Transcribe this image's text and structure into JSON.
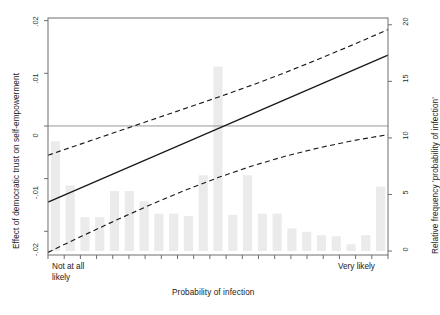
{
  "figure": {
    "axis_titles": {
      "left": "Effect of democratic trust on self-empowerment",
      "right": "Relative frequency 'probability of infection'",
      "bottom": "Probability of infection"
    },
    "x_endpoint_labels": {
      "left_line1": "Not at all",
      "left_line2": "likely",
      "right": "Very likely"
    },
    "caption": "",
    "colors": {
      "line": "#1a1a1a",
      "ci": "#1a1a1a",
      "bars": "#ebebeb",
      "zero_line": "#999999",
      "frame": "#6e6e6e",
      "background": "#ffffff"
    }
  },
  "chart_data": {
    "type": "line",
    "title": "",
    "subtitle": "",
    "xlabel": "Probability of infection",
    "ylabel": "Effect of democratic trust on self-empowerment",
    "y2label": "Relative frequency 'probability of infection'",
    "grid": false,
    "legend": "none",
    "xlim": [
      0,
      10
    ],
    "xtick_labels": [
      "Not at all likely",
      "Very likely"
    ],
    "xtick_values": [
      0,
      10
    ],
    "xticks_minor_count": 21,
    "ylim": [
      -0.0245,
      0.0205
    ],
    "ytick_labels": [
      ".02",
      ".01",
      "0",
      "-.01",
      "-.02"
    ],
    "ytick_values": [
      0.02,
      0.01,
      0,
      -0.01,
      -0.02
    ],
    "y2lim": [
      -0.35,
      20.6
    ],
    "y2tick_labels": [
      "0",
      "5",
      "10",
      "15",
      "20"
    ],
    "y2tick_values": [
      0,
      5,
      10,
      15,
      20
    ],
    "zero_reference_line": 0,
    "series": [
      {
        "name": "Marginal effect",
        "style": "solid",
        "x": [
          0,
          10
        ],
        "values": [
          -0.01445,
          0.01345
        ]
      },
      {
        "name": "Upper 95% confidence limit",
        "style": "dashed",
        "x": [
          0,
          1,
          2,
          3,
          4,
          5,
          6,
          7,
          8,
          9,
          10
        ],
        "values": [
          -0.00555,
          -0.00335,
          -0.00115,
          0.00105,
          0.00325,
          0.00545,
          0.00775,
          0.0102,
          0.0128,
          0.0155,
          0.0183
        ]
      },
      {
        "name": "Lower 95% confidence limit",
        "style": "dashed",
        "x": [
          0,
          1,
          2,
          3,
          4,
          5,
          6,
          7,
          8,
          9,
          10
        ],
        "values": [
          -0.024,
          -0.0209,
          -0.0179,
          -0.015,
          -0.0123,
          -0.0098,
          -0.0076,
          -0.0057,
          -0.0041,
          -0.00275,
          -0.00165
        ]
      }
    ],
    "histogram": {
      "name": "Relative frequency of 'probability of infection'",
      "axis": "right",
      "unit": "percent",
      "bin_centers": [
        0.25,
        0.72,
        1.2,
        1.68,
        2.15,
        2.63,
        3.1,
        3.58,
        4.05,
        4.53,
        5.0,
        5.48,
        5.95,
        6.43,
        6.9,
        7.38,
        7.85,
        8.33,
        8.8,
        9.28,
        9.75
      ],
      "values": [
        9.7,
        5.8,
        3.0,
        3.0,
        5.3,
        5.3,
        4.4,
        3.3,
        3.3,
        3.1,
        6.7,
        16.3,
        3.2,
        6.7,
        3.3,
        3.3,
        2.0,
        1.7,
        1.4,
        1.3,
        0.6,
        1.4,
        5.7
      ]
    }
  }
}
